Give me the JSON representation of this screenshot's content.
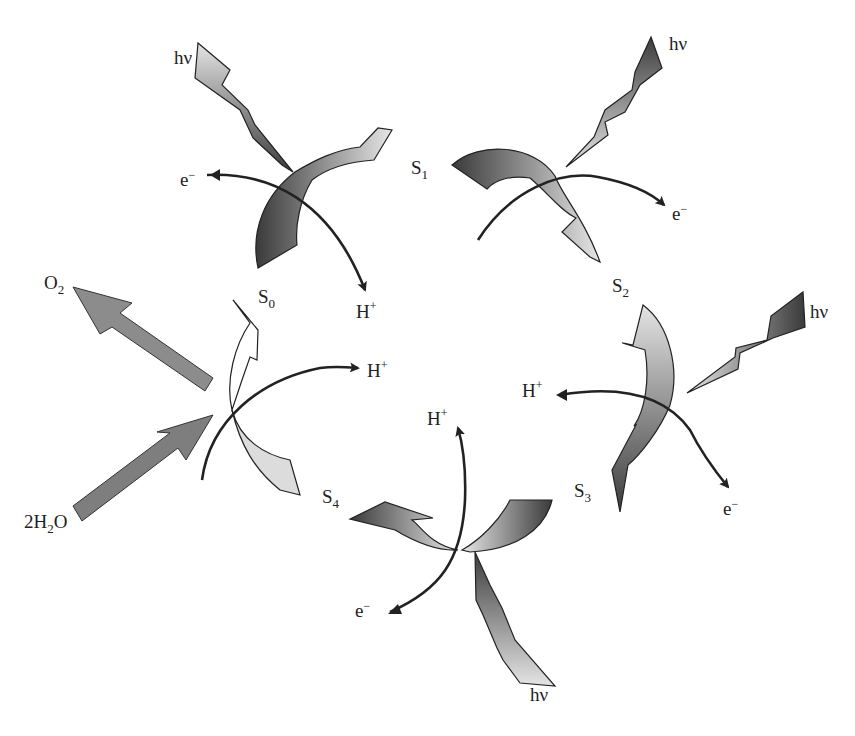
{
  "diagram": {
    "type": "cycle",
    "states": [
      {
        "id": "S0",
        "label": "S",
        "sub": "0"
      },
      {
        "id": "S1",
        "label": "S",
        "sub": "1"
      },
      {
        "id": "S2",
        "label": "S",
        "sub": "2"
      },
      {
        "id": "S3",
        "label": "S",
        "sub": "3"
      },
      {
        "id": "S4",
        "label": "S",
        "sub": "4"
      }
    ],
    "photon_label": "hν",
    "electron_label": "e",
    "electron_charge": "−",
    "proton_label": "H",
    "proton_charge": "+",
    "oxygen": {
      "label": "O",
      "sub": "2"
    },
    "water": {
      "prefix": "2H",
      "sub": "2",
      "suffix": "O"
    },
    "transitions": [
      {
        "from": "S0",
        "to": "S1",
        "inputs": [
          "hν"
        ],
        "outputs": [
          "e−",
          "H+"
        ]
      },
      {
        "from": "S1",
        "to": "S2",
        "inputs": [
          "hν"
        ],
        "outputs": [
          "e−"
        ]
      },
      {
        "from": "S2",
        "to": "S3",
        "inputs": [
          "hν"
        ],
        "outputs": [
          "e−",
          "H+"
        ]
      },
      {
        "from": "S3",
        "to": "S4",
        "inputs": [
          "hν"
        ],
        "outputs": [
          "e−",
          "H+"
        ]
      },
      {
        "from": "S4",
        "to": "S0",
        "inputs": [
          "2H2O"
        ],
        "outputs": [
          "O2",
          "H+"
        ]
      }
    ],
    "colors": {
      "arrow_dark": "#3a3a3a",
      "arrow_light": "#e8e8e8",
      "stroke": "#222222",
      "big_arrow": "#8a8a8a"
    }
  }
}
